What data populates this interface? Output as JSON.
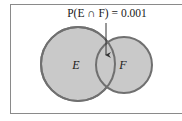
{
  "diagram": {
    "type": "venn",
    "annotation": "P(E ∩ F) = 0.001",
    "sets": [
      {
        "label": "E",
        "cx": 78,
        "cy": 64,
        "r": 37
      },
      {
        "label": "F",
        "cx": 124,
        "cy": 65,
        "r": 28
      }
    ],
    "intersection_label": "E ∩ F",
    "colors": {
      "fill": "#c9c9c9",
      "stroke": "#707070",
      "frame": "#8a8a8a",
      "text": "#1a1a1a"
    }
  }
}
